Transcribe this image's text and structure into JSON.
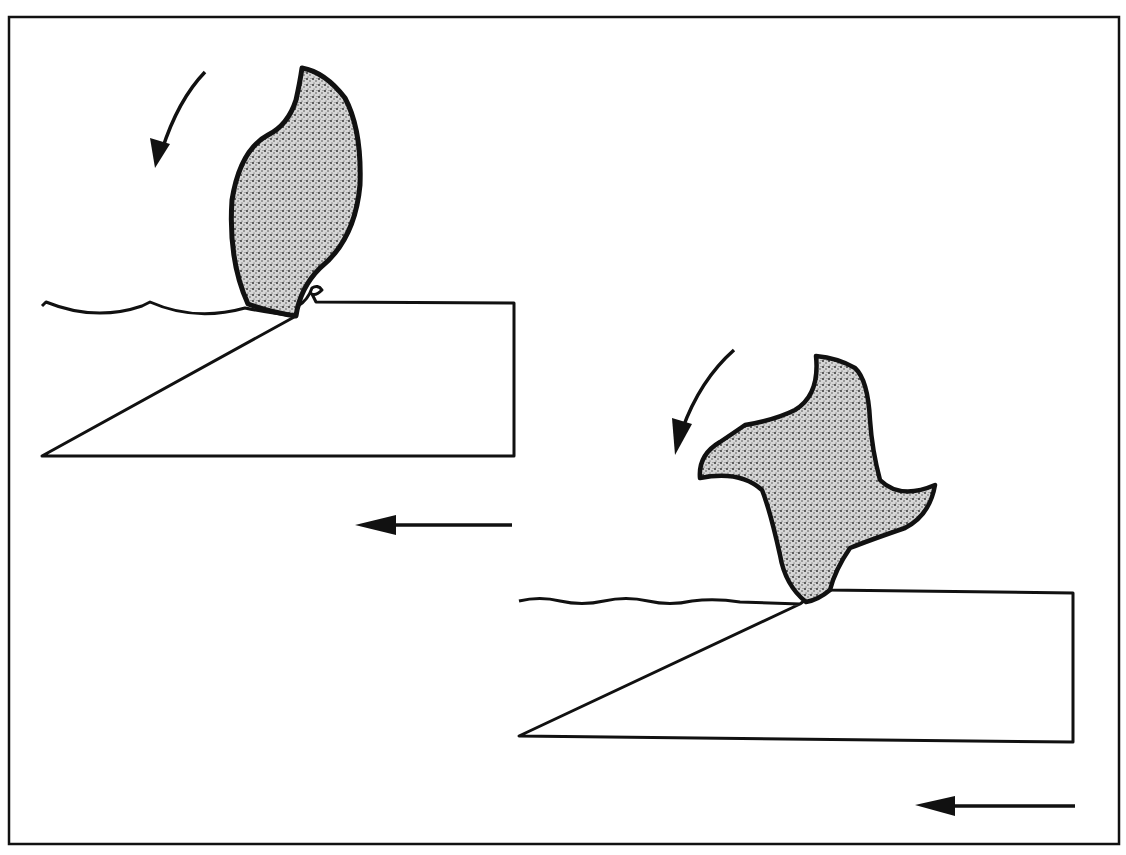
{
  "diagram": {
    "colors": {
      "line": "#111111",
      "fill": "#bdbdbd",
      "background": "#ffffff"
    },
    "panels": [
      {
        "id": "panel-1",
        "cutter": "single-tooth cutter",
        "rotation": "counterclockwise",
        "feed_direction": "left",
        "surface": "coarse scallops"
      },
      {
        "id": "panel-2",
        "cutter": "four-tooth cutter",
        "rotation": "counterclockwise",
        "feed_direction": "left",
        "surface": "fine scallops"
      }
    ],
    "visible_text": []
  }
}
